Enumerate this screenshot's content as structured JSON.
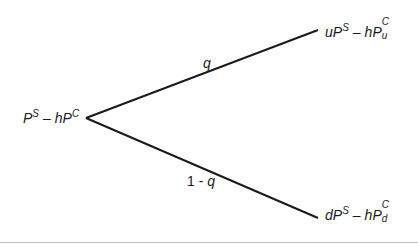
{
  "diagram": {
    "type": "binomial-tree",
    "root": {
      "base": "P",
      "base_sup": "S",
      "op": "–",
      "coef": "h",
      "term": "P",
      "term_sup": "C",
      "term_sub": ""
    },
    "up": {
      "prefix": "u",
      "base": "P",
      "base_sup": "S",
      "op": "–",
      "coef": "h",
      "term": "P",
      "term_sup": "C",
      "term_sub": "u"
    },
    "down": {
      "prefix": "d",
      "base": "P",
      "base_sup": "S",
      "op": "–",
      "coef": "h",
      "term": "P",
      "term_sup": "C",
      "term_sub": "d"
    },
    "up_prob": {
      "text": "q"
    },
    "down_prob": {
      "prefix": "1 - ",
      "var": "q"
    },
    "line_color": "#1a1a1a"
  }
}
